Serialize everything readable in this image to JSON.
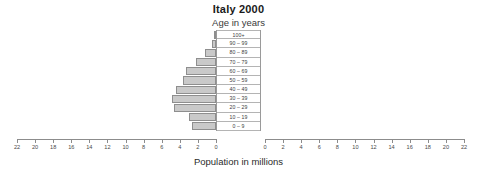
{
  "chart_data": {
    "type": "bar",
    "title": "Italy 2000",
    "subtitle": "Age in years",
    "xlabel": "Population in millions",
    "ylabel": "Age in years",
    "orientation": "population-pyramid",
    "grid": false,
    "legend_position": "none",
    "xlim": [
      0,
      22
    ],
    "xticks": [
      0,
      2,
      4,
      6,
      8,
      10,
      12,
      14,
      16,
      18,
      20,
      22
    ],
    "left_axis_ticklabels": [
      "22",
      "20",
      "18",
      "16",
      "14",
      "12",
      "10",
      "8",
      "6",
      "4",
      "2",
      "0"
    ],
    "right_axis_ticklabels": [
      "0",
      "2",
      "4",
      "6",
      "8",
      "10",
      "12",
      "14",
      "16",
      "18",
      "20",
      "22"
    ],
    "categories": [
      "100+",
      "90 – 99",
      "80 – 89",
      "70 – 79",
      "60 – 69",
      "50 – 59",
      "40 – 49",
      "30 – 39",
      "20 – 29",
      "10 – 19",
      "0 – 9"
    ],
    "series": [
      {
        "name": "Male",
        "side": "left",
        "color": "#c9c9c9",
        "values": [
          0.05,
          0.45,
          1.2,
          2.2,
          3.3,
          3.7,
          4.4,
          4.9,
          4.6,
          3.0,
          2.7
        ]
      },
      {
        "name": "Female",
        "side": "right",
        "color": "#ececec",
        "values": [
          0.08,
          0.75,
          1.7,
          2.7,
          3.6,
          3.9,
          4.5,
          4.8,
          4.5,
          2.9,
          2.5
        ]
      }
    ]
  },
  "colors": {
    "male_fill": "#c9c9c9",
    "male_border": "#8e8e8e",
    "female_fill": "#ececec",
    "female_border": "#bdbdbd",
    "axis": "#8c8c8c"
  }
}
